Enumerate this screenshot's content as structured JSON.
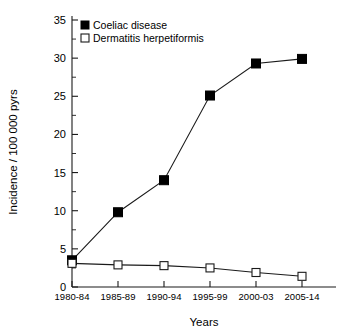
{
  "chart_data": {
    "type": "line",
    "title": "",
    "xlabel": "Years",
    "ylabel": "Incidence / 100 000 pyrs",
    "categories": [
      "1980-84",
      "1985-89",
      "1990-94",
      "1995-99",
      "2000-03",
      "2005-14"
    ],
    "series": [
      {
        "name": "Coeliac disease",
        "marker": "filled-square",
        "color": "#000000",
        "values": [
          3.5,
          9.8,
          14.0,
          25.1,
          29.3,
          29.9
        ]
      },
      {
        "name": "Dermatitis herpetiformis",
        "marker": "open-square",
        "color": "#000000",
        "values": [
          3.1,
          2.9,
          2.8,
          2.5,
          1.9,
          1.4
        ]
      }
    ],
    "ylim": [
      0,
      35
    ],
    "yticks": [
      0,
      5,
      10,
      15,
      20,
      25,
      30,
      35
    ],
    "yticks_minor": [
      2.5,
      7.5,
      12.5,
      17.5,
      22.5,
      27.5,
      32.5
    ],
    "ytick_labels": [
      "0",
      "5",
      "10",
      "15",
      "20",
      "25",
      "30",
      "35"
    ],
    "grid": false,
    "legend_position": "top-left-inside",
    "background_color": "#ffffff",
    "axis_color": "#1a1a1a"
  },
  "legend": {
    "entries": [
      {
        "label": "Coeliac disease",
        "marker": "filled-square"
      },
      {
        "label": "Dermatitis herpetiformis",
        "marker": "open-square"
      }
    ]
  },
  "axes": {
    "y_title": "Incidence / 100 000 pyrs",
    "x_title": "Years",
    "y_labels": [
      "35",
      "30",
      "25",
      "20",
      "15",
      "10",
      "5",
      "0"
    ],
    "x_labels": [
      "1980-84",
      "1985-89",
      "1990-94",
      "1995-99",
      "2000-03",
      "2005-14"
    ]
  }
}
